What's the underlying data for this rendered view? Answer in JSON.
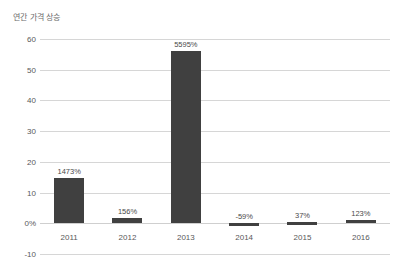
{
  "chart_data": {
    "type": "bar",
    "title": "연간 가격 상승",
    "xlabel": "",
    "ylabel": "",
    "categories": [
      "2011",
      "2012",
      "2013",
      "2014",
      "2015",
      "2016"
    ],
    "values": [
      14.73,
      1.56,
      55.95,
      -0.59,
      0.37,
      1.23
    ],
    "data_labels": [
      "1473%",
      "156%",
      "5595%",
      "-59%",
      "37%",
      "123%"
    ],
    "yticks": [
      60,
      50,
      40,
      30,
      20,
      10,
      0,
      -10
    ],
    "ytick_labels": [
      "60",
      "50",
      "40",
      "30",
      "20",
      "10",
      "0%",
      "-10"
    ],
    "ylim": [
      -10,
      60
    ],
    "grid": true,
    "legend": false,
    "bar_color": "#404040",
    "gridline_color": "#d6d6d6",
    "text_color": "#58585a",
    "background": "#ffffff"
  }
}
